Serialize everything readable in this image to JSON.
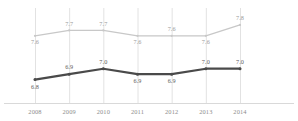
{
  "chart_data": {
    "type": "line",
    "title": "",
    "subtitle": "",
    "xlabel": "",
    "ylabel": "",
    "grid": "vertical",
    "legend_position": "none",
    "categories": [
      "2008",
      "2009",
      "2010",
      "2011",
      "2012",
      "2013",
      "2014"
    ],
    "ylim": [
      6.5,
      8.0
    ],
    "series": [
      {
        "name": "upper-series",
        "color": "#c8c8c8",
        "label_color": "#9a9a9a",
        "values": [
          7.6,
          7.7,
          7.7,
          7.6,
          7.6,
          7.6,
          7.8
        ],
        "labels": [
          "7.6",
          "7.7",
          "7.7",
          "7.6",
          "7.6",
          "7.6",
          "7.8"
        ],
        "label_side": [
          "below",
          "above",
          "above",
          "below",
          "above",
          "below",
          "above"
        ]
      },
      {
        "name": "lower-series",
        "color": "#4a4a4a",
        "label_color": "#5d5d5d",
        "values": [
          6.8,
          6.9,
          7.0,
          6.9,
          6.9,
          7.0,
          7.0
        ],
        "labels": [
          "6.8",
          "6.9",
          "7.0",
          "6.9",
          "6.9",
          "7.0",
          "7.0"
        ],
        "label_side": [
          "below",
          "above",
          "above",
          "below",
          "below",
          "above",
          "above"
        ]
      }
    ]
  },
  "axis": {
    "baseline_color": "#d9d9d9",
    "gridline_color": "#e2e2e2"
  },
  "tick_labels": {
    "t0": "2008",
    "t1": "2009",
    "t2": "2010",
    "t3": "2011",
    "t4": "2012",
    "t5": "2013",
    "t6": "2014"
  },
  "upper_labels": {
    "p0": "7.6",
    "p1": "7.7",
    "p2": "7.7",
    "p3": "7.6",
    "p4": "7.6",
    "p5": "7.6",
    "p6": "7.8"
  },
  "lower_labels": {
    "p0": "6.8",
    "p1": "6.9",
    "p2": "7.0",
    "p3": "6.9",
    "p4": "6.9",
    "p5": "7.0",
    "p6": "7.0"
  }
}
